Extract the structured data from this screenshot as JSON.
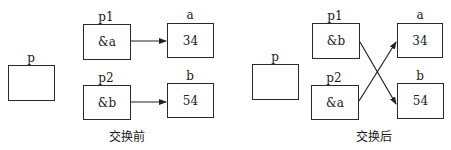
{
  "before": {
    "caption": "交换前",
    "p": {
      "label": "p",
      "value": ""
    },
    "p1": {
      "label": "p1",
      "value": "&a"
    },
    "p2": {
      "label": "p2",
      "value": "&b"
    },
    "a": {
      "label": "a",
      "value": "34"
    },
    "b": {
      "label": "b",
      "value": "54"
    },
    "arrows": [
      {
        "from": "p1",
        "to": "a"
      },
      {
        "from": "p2",
        "to": "b"
      }
    ]
  },
  "after": {
    "caption": "交换后",
    "p": {
      "label": "p",
      "value": ""
    },
    "p1": {
      "label": "p1",
      "value": "&b"
    },
    "p2": {
      "label": "p2",
      "value": "&a"
    },
    "a": {
      "label": "a",
      "value": "34"
    },
    "b": {
      "label": "b",
      "value": "54"
    },
    "arrows": [
      {
        "from": "p1",
        "to": "b"
      },
      {
        "from": "p2",
        "to": "a"
      }
    ]
  }
}
